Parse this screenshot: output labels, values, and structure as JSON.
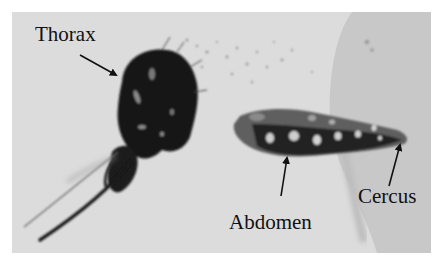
{
  "figure": {
    "labels": {
      "thorax": "Thorax",
      "abdomen": "Abdomen",
      "cercus": "Cercus"
    },
    "colors": {
      "background": "#dcdcdc",
      "coverslip": "#c9c9c9",
      "specimen_dark": "#141414",
      "abdomen_mid": "#5a5a5a",
      "text": "#111111"
    }
  }
}
